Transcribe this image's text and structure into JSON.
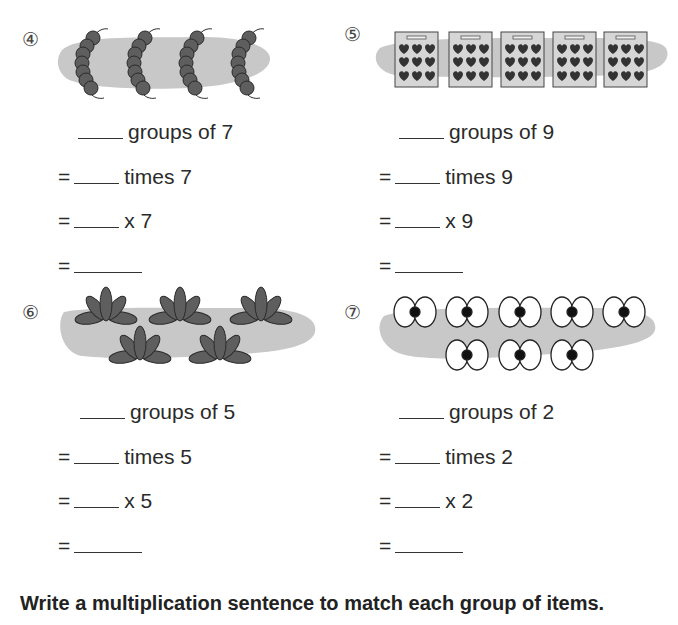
{
  "problems": [
    {
      "number": "④",
      "item": "caterpillar",
      "group_count": 4,
      "line1_suffix": "groups of 7",
      "line2_prefix": "=",
      "line2_suffix": "times 7",
      "line3_prefix": "=",
      "line3_suffix": "x 7",
      "line4_prefix": "="
    },
    {
      "number": "⑤",
      "item": "heart-card",
      "group_count": 5,
      "line1_suffix": "groups of 9",
      "line2_prefix": "=",
      "line2_suffix": "times 9",
      "line3_prefix": "=",
      "line3_suffix": "x 9",
      "line4_prefix": "="
    },
    {
      "number": "⑥",
      "item": "plant",
      "group_count": 5,
      "line1_suffix": "groups of 5",
      "line2_prefix": "=",
      "line2_suffix": "times 5",
      "line3_prefix": "=",
      "line3_suffix": "x 5",
      "line4_prefix": "="
    },
    {
      "number": "⑦",
      "item": "eye-pair",
      "group_count": 8,
      "line1_suffix": "groups of 2",
      "line2_prefix": "=",
      "line2_suffix": "times 2",
      "line3_prefix": "=",
      "line3_suffix": "x 2",
      "line4_prefix": "="
    }
  ],
  "instruction": "Write a multiplication sentence to match each group of items.",
  "colors": {
    "blob": "#c8c8c8",
    "item_dark": "#5a5a5a",
    "card_bg": "#d6d6d6",
    "heart": "#333333"
  }
}
